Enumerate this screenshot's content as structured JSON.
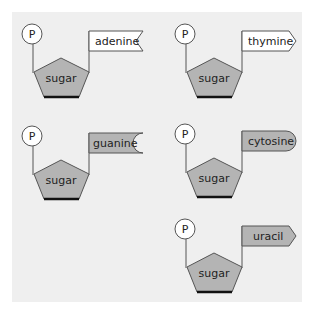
{
  "diagram": {
    "colors": {
      "background": "#efefef",
      "sugar_fill": "#b4b4b4",
      "purine_tag_fill": "#ffffff",
      "gray_tag_fill": "#b4b4b4",
      "stroke": "#555555",
      "base_edge": "#111111"
    },
    "nucleotides": [
      {
        "phosphate": "P",
        "sugar": "sugar",
        "base": "adenine",
        "tag_shape": "notch-inward-point",
        "tag_fill": "#ffffff"
      },
      {
        "phosphate": "P",
        "sugar": "sugar",
        "base": "thymine",
        "tag_shape": "arrow-point",
        "tag_fill": "#ffffff"
      },
      {
        "phosphate": "P",
        "sugar": "sugar",
        "base": "guanine",
        "tag_shape": "notch-inward-round",
        "tag_fill": "#b4b4b4"
      },
      {
        "phosphate": "P",
        "sugar": "sugar",
        "base": "cytosine",
        "tag_shape": "round-end",
        "tag_fill": "#b4b4b4"
      },
      {
        "phosphate": "P",
        "sugar": "sugar",
        "base": "uracil",
        "tag_shape": "arrow-point",
        "tag_fill": "#b4b4b4"
      }
    ]
  }
}
